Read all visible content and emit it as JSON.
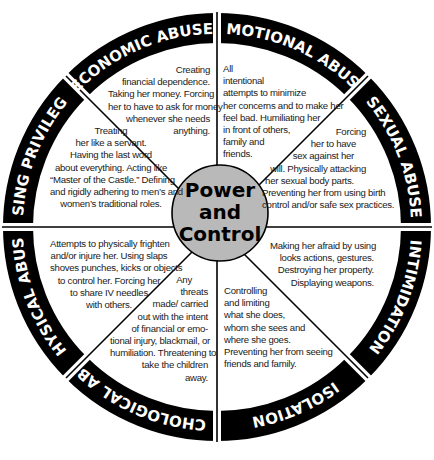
{
  "diagram": {
    "type": "wheel",
    "title_center": [
      "Power",
      "and",
      "Control"
    ],
    "colors": {
      "ring": "#000000",
      "ring_text": "#ffffff",
      "center_fill": "#b9b9b9",
      "background": "#ffffff",
      "divider": "#000000"
    },
    "segments": [
      {
        "label": "ECONOMIC ABUSE",
        "lines": [
          "Creating",
          "financial dependence.",
          "Taking her money. Forcing",
          "her to have to ask for money",
          "whenever she needs",
          "anything."
        ]
      },
      {
        "label": "EMOTIONAL ABUSE",
        "lines": [
          "All",
          "intentional",
          "attempts to minimize",
          "her concerns and to make her",
          "feel bad. Humiliating her",
          "in front of others,",
          "family and",
          "friends."
        ]
      },
      {
        "label": "SEXUAL ABUSE",
        "lines": [
          "Forcing",
          "her to have",
          "sex against her",
          "will. Physically attacking",
          "her sexual body parts.",
          "Preventing her from using birth",
          "control and/or safe sex practices."
        ]
      },
      {
        "label": "INTIMIDATION",
        "lines": [
          "Making her afraid by using",
          "looks actions, gestures.",
          "Destroying her property.",
          "Displaying weapons."
        ]
      },
      {
        "label": "ISOLATION",
        "lines": [
          "Controlling",
          "and limiting",
          "what she does,",
          "whom she sees and",
          "where she goes.",
          "Preventing her from seeing",
          "friends and family."
        ]
      },
      {
        "label": "PSYCHOLOGICAL ABUSE",
        "lines": [
          "Any",
          "threats",
          "made/ carried",
          "out with the intent",
          "of financial or emo-",
          "tional injury, blackmail, or",
          "humiliation. Threatening to",
          "take the children",
          "away."
        ]
      },
      {
        "label": "PHYSICAL ABUSE",
        "lines": [
          "Attempts to physically frighten",
          "and/or injure her. Using slaps",
          "shoves punches, kicks or objects",
          "to control her. Forcing her",
          "to share IV needles",
          "with others."
        ]
      },
      {
        "label": "USING PRIVILEGE",
        "lines": [
          "Treating",
          "her like a servant.",
          "Having the last word",
          "about everything. Acting like",
          "“Master of the Castle.” Defining",
          "and rigidly adhering to men’s and",
          "women’s traditional roles."
        ]
      }
    ]
  }
}
